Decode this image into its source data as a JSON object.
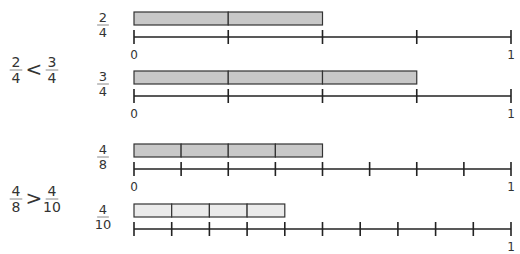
{
  "comparisons": [
    {
      "left": {
        "numerator": "2",
        "denominator": "4"
      },
      "operator": "<",
      "right": {
        "numerator": "3",
        "denominator": "4"
      }
    },
    {
      "left": {
        "numerator": "4",
        "denominator": "8"
      },
      "operator": ">",
      "right": {
        "numerator": "4",
        "denominator": "10"
      }
    }
  ],
  "number_lines": [
    {
      "label": {
        "numerator": "2",
        "denominator": "4"
      },
      "divisions": 4,
      "shaded": 2,
      "bar_color": "#c8c8c8",
      "start_label": "0",
      "end_label": "1"
    },
    {
      "label": {
        "numerator": "3",
        "denominator": "4"
      },
      "divisions": 4,
      "shaded": 3,
      "bar_color": "#c8c8c8",
      "start_label": "0",
      "end_label": "1"
    },
    {
      "label": {
        "numerator": "4",
        "denominator": "8"
      },
      "divisions": 8,
      "shaded": 4,
      "bar_color": "#c8c8c8",
      "start_label": "0",
      "end_label": "1"
    },
    {
      "label": {
        "numerator": "4",
        "denominator": "10"
      },
      "divisions": 10,
      "shaded": 4,
      "bar_color": "#ebebeb",
      "start_label": "",
      "end_label": "1"
    }
  ],
  "colors": {
    "line": "#222222",
    "text": "#333333"
  }
}
